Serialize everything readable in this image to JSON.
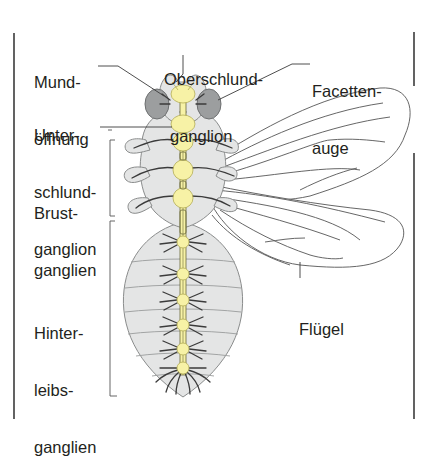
{
  "diagram": {
    "colors": {
      "body_fill": "#e4e5e5",
      "body_stroke": "#8a8c8c",
      "ganglion_fill": "#f7f2a6",
      "eye_fill": "#9c9e9f",
      "line": "#3b3b3b",
      "text": "#231f20",
      "frame": "#3b3b3b"
    },
    "labels": {
      "mundoeffnung": [
        "Mund-",
        "öffnung"
      ],
      "oberschlundganglion": [
        "Oberschlund-",
        "ganglion"
      ],
      "facettenauge": [
        "Facetten-",
        "auge"
      ],
      "unterschlundganglion": [
        "Unter-",
        "schlund-",
        "ganglion"
      ],
      "brustganglien": [
        "Brust-",
        "ganglien"
      ],
      "hinterleibsganglien": [
        "Hinter-",
        "leibs-",
        "ganglien"
      ],
      "fluegel": [
        "Flügel"
      ]
    }
  }
}
